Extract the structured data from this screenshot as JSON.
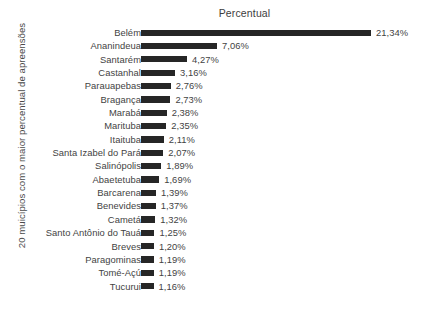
{
  "chart_data": {
    "type": "bar",
    "orientation": "horizontal",
    "title": "Percentual",
    "xlabel": "",
    "ylabel": "20 muicípios com o maior percentual de apreensões",
    "grid": false,
    "legend": false,
    "xlim": [
      0,
      21.34
    ],
    "value_suffix": "%",
    "decimal_separator": ",",
    "bar_color": "#262626",
    "text_color": "#434343",
    "background_color": "#ffffff",
    "categories": [
      "Belém",
      "Ananindeua",
      "Santarém",
      "Castanhal",
      "Parauapebas",
      "Bragança",
      "Marabá",
      "Marituba",
      "Itaituba",
      "Santa Izabel do Pará",
      "Salinópolis",
      "Abaetetuba",
      "Barcarena",
      "Benevides",
      "Cametá",
      "Santo Antônio do Tauá",
      "Breves",
      "Paragominas",
      "Tomé-Açú",
      "Tucurui"
    ],
    "values": [
      21.34,
      7.06,
      4.27,
      3.16,
      2.76,
      2.73,
      2.38,
      2.35,
      2.11,
      2.07,
      1.89,
      1.69,
      1.39,
      1.37,
      1.32,
      1.25,
      1.2,
      1.19,
      1.19,
      1.16
    ],
    "value_labels": [
      "21,34%",
      "7,06%",
      "4,27%",
      "3,16%",
      "2,76%",
      "2,73%",
      "2,38%",
      "2,35%",
      "2,11%",
      "2,07%",
      "1,89%",
      "1,69%",
      "1,39%",
      "1,37%",
      "1,32%",
      "1,25%",
      "1,20%",
      "1,19%",
      "1,19%",
      "1,16%"
    ]
  }
}
